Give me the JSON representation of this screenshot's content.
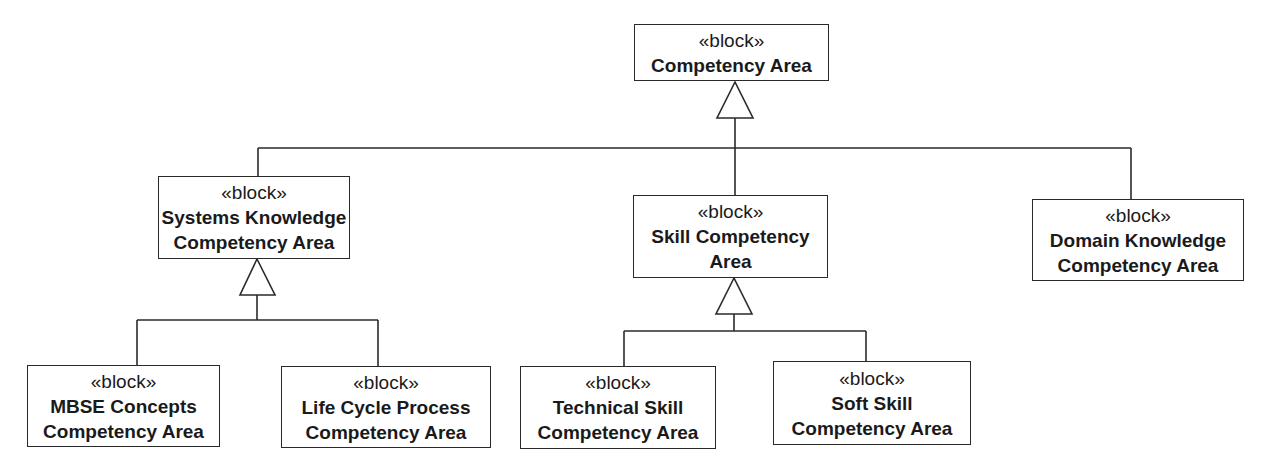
{
  "diagram": {
    "type": "SysML block definition (generalization hierarchy)",
    "blocks": [
      {
        "id": "root",
        "stereotype": "«block»",
        "lines": [
          "Competency Area"
        ]
      },
      {
        "id": "systems",
        "stereotype": "«block»",
        "lines": [
          "Systems Knowledge",
          "Competency Area"
        ]
      },
      {
        "id": "skill",
        "stereotype": "«block»",
        "lines": [
          "Skill Competency",
          "Area"
        ]
      },
      {
        "id": "domain",
        "stereotype": "«block»",
        "lines": [
          "Domain Knowledge",
          "Competency Area"
        ]
      },
      {
        "id": "mbse",
        "stereotype": "«block»",
        "lines": [
          "MBSE Concepts",
          "Competency Area"
        ]
      },
      {
        "id": "lifecycle",
        "stereotype": "«block»",
        "lines": [
          "Life Cycle Process",
          "Competency Area"
        ]
      },
      {
        "id": "technical",
        "stereotype": "«block»",
        "lines": [
          "Technical Skill",
          "Competency Area"
        ]
      },
      {
        "id": "soft",
        "stereotype": "«block»",
        "lines": [
          "Soft Skill",
          "Competency Area"
        ]
      }
    ],
    "generalizations": [
      {
        "parent": "root",
        "children": [
          "systems",
          "skill",
          "domain"
        ]
      },
      {
        "parent": "systems",
        "children": [
          "mbse",
          "lifecycle"
        ]
      },
      {
        "parent": "skill",
        "children": [
          "technical",
          "soft"
        ]
      }
    ]
  }
}
